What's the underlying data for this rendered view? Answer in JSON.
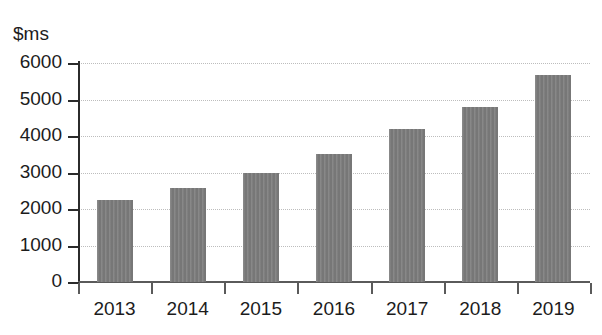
{
  "chart_data": {
    "type": "bar",
    "title": "",
    "subtitle": "",
    "xlabel": "",
    "ylabel": "$ms",
    "categories": [
      "2013",
      "2014",
      "2015",
      "2016",
      "2017",
      "2018",
      "2019"
    ],
    "values": [
      2250,
      2575,
      3000,
      3500,
      4180,
      4800,
      5670
    ],
    "series": [
      {
        "name": "",
        "values": [
          2250,
          2575,
          3000,
          3500,
          4180,
          4800,
          5670
        ]
      }
    ],
    "ylim": [
      0,
      6000
    ],
    "yticks": [
      0,
      1000,
      2000,
      3000,
      4000,
      5000,
      6000
    ],
    "ytick_labels": [
      "0",
      "1000",
      "2000",
      "3000",
      "4000",
      "5000",
      "6000"
    ],
    "grid": "horizontal-dotted",
    "legend": "none",
    "bar_color": "#7d7d7d",
    "axis_color": "#2b2b2b",
    "gridline_color": "#bdbdbd",
    "text_color": "#1c1c1c",
    "background_color": "#ffffff"
  }
}
